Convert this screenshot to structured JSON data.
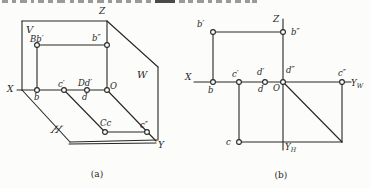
{
  "style": {
    "background": "#fcfcfa",
    "ink": "#262626",
    "fragment_color": "#9a9a96",
    "fragment_dark_color": "#4a4a46",
    "point_radius": 2.4
  },
  "top_crop": {
    "fragments": [
      {
        "x": 2,
        "w": 6
      },
      {
        "x": 12,
        "w": 4
      },
      {
        "x": 20,
        "w": 7
      },
      {
        "x": 31,
        "w": 3
      },
      {
        "x": 38,
        "w": 6
      },
      {
        "x": 48,
        "w": 5
      },
      {
        "x": 57,
        "w": 8
      },
      {
        "x": 70,
        "w": 4
      },
      {
        "x": 78,
        "w": 6
      },
      {
        "x": 88,
        "w": 5
      },
      {
        "x": 97,
        "w": 7
      },
      {
        "x": 108,
        "w": 4
      },
      {
        "x": 116,
        "w": 6
      },
      {
        "x": 126,
        "w": 5
      },
      {
        "x": 135,
        "w": 7
      },
      {
        "x": 146,
        "w": 5
      },
      {
        "x": 155,
        "w": 20,
        "dark": true
      },
      {
        "x": 179,
        "w": 6
      },
      {
        "x": 188,
        "w": 5
      },
      {
        "x": 197,
        "w": 7
      },
      {
        "x": 208,
        "w": 4
      },
      {
        "x": 216,
        "w": 6
      },
      {
        "x": 226,
        "w": 5
      },
      {
        "x": 235,
        "w": 6
      },
      {
        "x": 245,
        "w": 5
      },
      {
        "x": 252,
        "w": 5
      }
    ]
  },
  "figures": [
    {
      "id": "a",
      "caption": "(a)",
      "lines": [
        {
          "name": "v-plane-top-edge",
          "p": [
            22,
            21,
            107,
            21
          ]
        },
        {
          "name": "v-plane-left-edge",
          "p": [
            22,
            21,
            22,
            90
          ]
        },
        {
          "name": "x-axis",
          "p": [
            17,
            90,
            107,
            90
          ]
        },
        {
          "name": "z-axis",
          "p": [
            107,
            21,
            107,
            90
          ]
        },
        {
          "name": "w-plane-top-diagonal",
          "p": [
            107,
            21,
            158,
            67
          ]
        },
        {
          "name": "w-plane-right-edge",
          "p": [
            158,
            67,
            158,
            140
          ]
        },
        {
          "name": "y-axis",
          "p": [
            107,
            90,
            156,
            141
          ]
        },
        {
          "name": "h-plane-left-slant",
          "p": [
            22,
            90,
            70,
            142
          ]
        },
        {
          "name": "h-plane-bottom-inner",
          "p": [
            70,
            142,
            157,
            140
          ]
        },
        {
          "name": "h-plane-bottom-outer",
          "p": [
            69,
            144,
            156,
            143
          ]
        },
        {
          "name": "projector-bprime-bdouble",
          "p": [
            37,
            45,
            107,
            45
          ]
        },
        {
          "name": "projector-bprime-b",
          "p": [
            37,
            45,
            37,
            90
          ]
        },
        {
          "name": "projector-cprime-c",
          "p": [
            64,
            90,
            105,
            132
          ]
        },
        {
          "name": "projector-c-cdouble",
          "p": [
            105,
            132,
            147,
            132
          ]
        }
      ],
      "points": [
        {
          "name": "B-b-prime",
          "x": 37,
          "y": 45
        },
        {
          "name": "b-double-prime",
          "x": 107,
          "y": 45
        },
        {
          "name": "b",
          "x": 37,
          "y": 90
        },
        {
          "name": "c-prime",
          "x": 64,
          "y": 90
        },
        {
          "name": "D-d-prime",
          "x": 87,
          "y": 90
        },
        {
          "name": "origin-O",
          "x": 107,
          "y": 90
        },
        {
          "name": "C-c",
          "x": 105,
          "y": 132
        },
        {
          "name": "c-double-prime",
          "x": 147,
          "y": 132
        }
      ],
      "labels": [
        {
          "name": "plane-v",
          "t": "V",
          "x": 26,
          "y": 33,
          "fs": 10
        },
        {
          "name": "axis-z",
          "t": "Z",
          "x": 99,
          "y": 14,
          "fs": 9
        },
        {
          "name": "axis-x",
          "t": "X",
          "x": 7,
          "y": 92,
          "fs": 9
        },
        {
          "name": "plane-w",
          "t": "W",
          "x": 137,
          "y": 78,
          "fs": 10
        },
        {
          "name": "plane-h",
          "t": "H",
          "x": 50,
          "y": 133,
          "fs": 10,
          "skew": true
        },
        {
          "name": "axis-y",
          "t": "Y",
          "x": 158,
          "y": 148,
          "fs": 9
        },
        {
          "name": "origin-O",
          "t": "O",
          "x": 110,
          "y": 89,
          "fs": 8.5
        },
        {
          "name": "point-B-b-prime",
          "t": "Bb′",
          "x": 30,
          "y": 42,
          "fs": 8.5
        },
        {
          "name": "point-b-double-prime",
          "t": "b″",
          "x": 92,
          "y": 41,
          "fs": 8.5
        },
        {
          "name": "point-b",
          "t": "b",
          "x": 34,
          "y": 100,
          "fs": 8.5
        },
        {
          "name": "point-c-prime",
          "t": "c′",
          "x": 58,
          "y": 87,
          "fs": 8.5
        },
        {
          "name": "point-D-d-prime",
          "t": "Dd′",
          "x": 78,
          "y": 86,
          "fs": 8.5
        },
        {
          "name": "point-d",
          "t": "d",
          "x": 82,
          "y": 100,
          "fs": 8.5
        },
        {
          "name": "point-C-c",
          "t": "Cc",
          "x": 100,
          "y": 126,
          "fs": 8.5
        },
        {
          "name": "point-c-double-prime",
          "t": "c″",
          "x": 140,
          "y": 128,
          "fs": 8.5
        }
      ]
    },
    {
      "id": "b",
      "caption": "(b)",
      "lines": [
        {
          "name": "x-axis",
          "p": [
            194,
            82,
            351,
            82
          ]
        },
        {
          "name": "z-yh-axis",
          "p": [
            283,
            19,
            283,
            150
          ]
        },
        {
          "name": "projector-bprime-bdouble",
          "p": [
            213,
            32,
            283,
            32
          ]
        },
        {
          "name": "projector-bprime-b",
          "p": [
            213,
            32,
            213,
            82
          ]
        },
        {
          "name": "projector-cprime-c",
          "p": [
            239,
            82,
            239,
            142
          ]
        },
        {
          "name": "transfer-c-horizontal",
          "p": [
            239,
            142,
            342,
            142
          ]
        },
        {
          "name": "transfer-vertical-cdouble",
          "p": [
            342,
            142,
            342,
            82
          ]
        },
        {
          "name": "transfer-45-diagonal",
          "p": [
            283,
            82,
            342,
            142
          ]
        }
      ],
      "points": [
        {
          "name": "b-prime",
          "x": 213,
          "y": 32
        },
        {
          "name": "b-double-prime",
          "x": 283,
          "y": 32
        },
        {
          "name": "b",
          "x": 213,
          "y": 82
        },
        {
          "name": "c-prime",
          "x": 239,
          "y": 82
        },
        {
          "name": "d-d-prime",
          "x": 265,
          "y": 82
        },
        {
          "name": "d-double-prime-origin",
          "x": 283,
          "y": 82
        },
        {
          "name": "c-double-prime",
          "x": 342,
          "y": 82
        },
        {
          "name": "c",
          "x": 239,
          "y": 142
        }
      ],
      "labels": [
        {
          "name": "axis-z",
          "t": "Z",
          "x": 273,
          "y": 22,
          "fs": 9
        },
        {
          "name": "axis-x",
          "t": "X",
          "x": 185,
          "y": 80,
          "fs": 9
        },
        {
          "name": "point-b-prime",
          "t": "b′",
          "x": 197,
          "y": 27,
          "fs": 8.5
        },
        {
          "name": "point-b-double-prime",
          "t": "b″",
          "x": 291,
          "y": 35,
          "fs": 8.5
        },
        {
          "name": "point-b",
          "t": "b",
          "x": 208,
          "y": 93,
          "fs": 8.5
        },
        {
          "name": "point-c-prime",
          "t": "c′",
          "x": 232,
          "y": 77,
          "fs": 8.5
        },
        {
          "name": "point-d-prime",
          "t": "d′",
          "x": 257,
          "y": 75,
          "fs": 8.5
        },
        {
          "name": "point-d-double-prime",
          "t": "d″",
          "x": 286,
          "y": 73,
          "fs": 8.5
        },
        {
          "name": "point-d",
          "t": "d",
          "x": 258,
          "y": 92,
          "fs": 8.5
        },
        {
          "name": "origin-O",
          "t": "O",
          "x": 273,
          "y": 91,
          "fs": 8.5
        },
        {
          "name": "point-c",
          "t": "c",
          "x": 226,
          "y": 145,
          "fs": 8.5
        },
        {
          "name": "point-c-double-prime",
          "t": "c″",
          "x": 338,
          "y": 76,
          "fs": 8.5
        },
        {
          "name": "axis-yw",
          "t": "Y",
          "sub": "W",
          "x": 351,
          "y": 86,
          "fs": 8.5
        },
        {
          "name": "axis-yh",
          "t": "Y",
          "sub": "H",
          "x": 285,
          "y": 150,
          "fs": 8.5
        }
      ]
    }
  ]
}
